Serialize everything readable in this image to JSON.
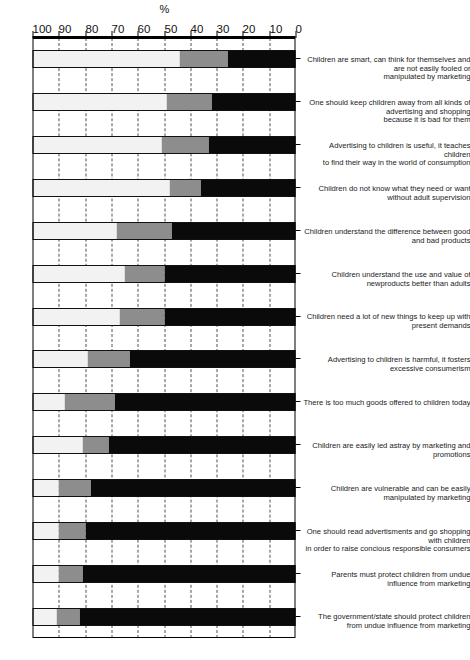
{
  "chart_data": {
    "type": "bar",
    "subtype": "stacked-100-horizontal",
    "title": "",
    "xlabel": "",
    "ylabel": "%",
    "axis_unit": "%",
    "ylim": [
      0,
      100
    ],
    "ticks": [
      0,
      10,
      20,
      30,
      40,
      50,
      60,
      70,
      80,
      90,
      100
    ],
    "grid": true,
    "grid_style": "dashed",
    "legend": [],
    "orientation": "rotated-90",
    "categories": [
      "The government/state should protect children\nfrom undue influence from marketing",
      "Parents must protect children from undue influence from marketing",
      "One should read advertisments and go shopping with children\nin order to raise concious responsible consumers",
      "Children are vulnerable and can be easily manipulated by marketing",
      "Children are easily led astray by marketing and promotions",
      "There is too much goods offered to children today",
      "Advertising to children is harmful, it fosters excessive consumerism",
      "Children need a lot of new things to keep up with present demands",
      "Children understand the use and value of newproducts better than adults",
      "Children understand the difference between good and bad products",
      "Children do not know what they need or want without adult supervision",
      "Advertising to children is useful, it teaches children\nto find their way in the world of consumption",
      "One should keep children away from all kinds of advertising and shopping\nbecause it is bad for them",
      "Children are smart, can think for themselves and are not easily fooled or\nmanipulated by marketing"
    ],
    "series": [
      {
        "name": "agree",
        "color": "#0a0a0a",
        "values": [
          82,
          81,
          80,
          78,
          71,
          69,
          63,
          50,
          50,
          47,
          36,
          33,
          32,
          26
        ]
      },
      {
        "name": "neutral",
        "color": "#8d8d8d",
        "values": [
          9,
          9,
          10,
          12,
          10,
          19,
          16,
          17,
          15,
          21,
          12,
          18,
          17,
          18
        ]
      },
      {
        "name": "disagree",
        "color": "#f2f2f2",
        "values": [
          9,
          10,
          10,
          10,
          19,
          12,
          21,
          33,
          35,
          32,
          52,
          49,
          51,
          56
        ]
      }
    ],
    "tick_labels": [
      "0",
      "10",
      "20",
      "30",
      "40",
      "50",
      "60",
      "70",
      "80",
      "90",
      "100"
    ]
  }
}
